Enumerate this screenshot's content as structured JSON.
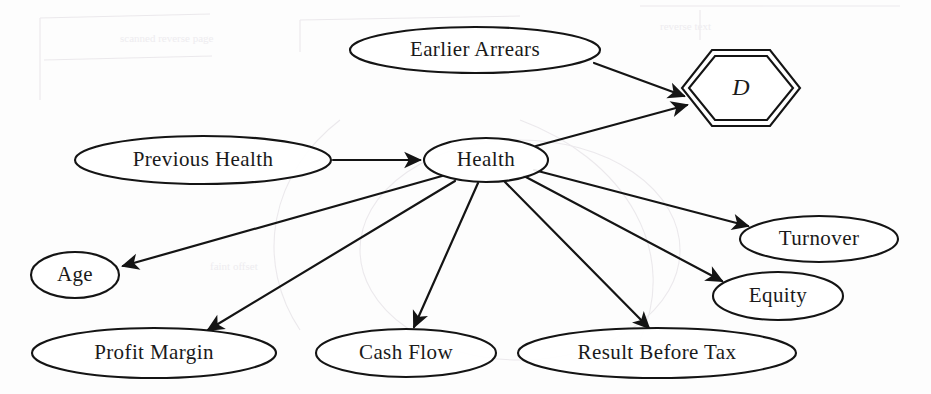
{
  "diagram": {
    "type": "directed-acyclic-graph",
    "background_color": "#fdfdfd",
    "stroke_color": "#141414",
    "nodes": [
      {
        "id": "earlier_arrears",
        "label": "Earlier Arrears",
        "shape": "ellipse",
        "cx": 475,
        "cy": 50,
        "rx": 125,
        "ry": 23
      },
      {
        "id": "decision_d",
        "label": "D",
        "shape": "hexagon-double",
        "cx": 741,
        "cy": 88,
        "rx": 59,
        "ry": 38,
        "italic": true
      },
      {
        "id": "previous_health",
        "label": "Previous Health",
        "shape": "ellipse",
        "cx": 203,
        "cy": 160,
        "rx": 128,
        "ry": 24
      },
      {
        "id": "health",
        "label": "Health",
        "shape": "ellipse",
        "cx": 486,
        "cy": 160,
        "rx": 62,
        "ry": 22
      },
      {
        "id": "turnover",
        "label": "Turnover",
        "shape": "ellipse",
        "cx": 819,
        "cy": 239,
        "rx": 79,
        "ry": 23
      },
      {
        "id": "equity",
        "label": "Equity",
        "shape": "ellipse",
        "cx": 778,
        "cy": 296,
        "rx": 65,
        "ry": 24
      },
      {
        "id": "age",
        "label": "Age",
        "shape": "ellipse",
        "cx": 75,
        "cy": 275,
        "rx": 44,
        "ry": 23
      },
      {
        "id": "profit_margin",
        "label": "Profit Margin",
        "shape": "ellipse",
        "cx": 154,
        "cy": 353,
        "rx": 122,
        "ry": 25
      },
      {
        "id": "cash_flow",
        "label": "Cash Flow",
        "shape": "ellipse",
        "cx": 406,
        "cy": 353,
        "rx": 90,
        "ry": 24
      },
      {
        "id": "result_before_tax",
        "label": "Result Before Tax",
        "shape": "ellipse",
        "cx": 657,
        "cy": 353,
        "rx": 139,
        "ry": 25
      }
    ],
    "edges": [
      {
        "id": "e1",
        "from": "earlier_arrears",
        "to": "decision_d",
        "from_label": "Earlier Arrears",
        "to_label": "D"
      },
      {
        "id": "e2",
        "from": "health",
        "to": "decision_d",
        "from_label": "Health",
        "to_label": "D"
      },
      {
        "id": "e3",
        "from": "previous_health",
        "to": "health",
        "from_label": "Previous Health",
        "to_label": "Health"
      },
      {
        "id": "e4",
        "from": "health",
        "to": "age",
        "from_label": "Health",
        "to_label": "Age"
      },
      {
        "id": "e5",
        "from": "health",
        "to": "profit_margin",
        "from_label": "Health",
        "to_label": "Profit Margin"
      },
      {
        "id": "e6",
        "from": "health",
        "to": "cash_flow",
        "from_label": "Health",
        "to_label": "Cash Flow"
      },
      {
        "id": "e7",
        "from": "health",
        "to": "result_before_tax",
        "from_label": "Health",
        "to_label": "Result Before Tax"
      },
      {
        "id": "e8",
        "from": "health",
        "to": "equity",
        "from_label": "Health",
        "to_label": "Equity"
      },
      {
        "id": "e9",
        "from": "health",
        "to": "turnover",
        "from_label": "Health",
        "to_label": "Turnover"
      }
    ]
  }
}
